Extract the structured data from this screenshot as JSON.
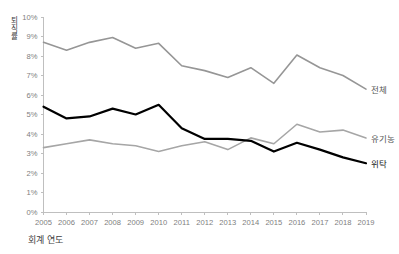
{
  "chart_data": {
    "type": "line",
    "title": "",
    "xlabel": "회계 연도",
    "ylabel": "퇴직률",
    "categories": [
      2005,
      2006,
      2007,
      2008,
      2009,
      2010,
      2011,
      2012,
      2013,
      2014,
      2015,
      2016,
      2017,
      2018,
      2019
    ],
    "x_tick_labels": [
      "2005",
      "2006",
      "2007",
      "2008",
      "2009",
      "2010",
      "2011",
      "2012",
      "2013",
      "2014",
      "2015",
      "2016",
      "2017",
      "2018",
      "2019"
    ],
    "y_tick_labels": [
      "10%",
      "9%",
      "8%",
      "7%",
      "6%",
      "5%",
      "4%",
      "3%",
      "2%",
      "1%",
      "0%"
    ],
    "y_tick_values": [
      10,
      9,
      8,
      7,
      6,
      5,
      4,
      3,
      2,
      1,
      0
    ],
    "ylim": [
      0,
      10
    ],
    "xlim": [
      2005,
      2019
    ],
    "y_unit": "%",
    "grid": false,
    "legend_position": "right-of-line-end",
    "series": [
      {
        "name": "전체",
        "color": "#969696",
        "width": 1.6,
        "values": [
          8.7,
          8.3,
          8.7,
          8.95,
          8.4,
          8.65,
          7.5,
          7.25,
          6.9,
          7.4,
          6.6,
          8.05,
          7.4,
          7.0,
          6.3
        ]
      },
      {
        "name": "유기농",
        "color": "#a6a6a6",
        "width": 1.6,
        "values": [
          3.3,
          3.5,
          3.7,
          3.5,
          3.4,
          3.1,
          3.4,
          3.6,
          3.2,
          3.8,
          3.5,
          4.5,
          4.1,
          4.2,
          3.8
        ]
      },
      {
        "name": "위탁",
        "color": "#000000",
        "width": 2.2,
        "values": [
          5.4,
          4.8,
          4.9,
          5.3,
          5.0,
          5.5,
          4.3,
          3.75,
          3.75,
          3.65,
          3.1,
          3.55,
          3.2,
          2.8,
          2.5
        ]
      }
    ]
  },
  "legend": {
    "items": [
      {
        "label": "전체"
      },
      {
        "label": "유기농"
      },
      {
        "label": "위탁"
      }
    ]
  },
  "axes": {
    "y_title": "퇴직률",
    "x_title": "회계 연도"
  }
}
